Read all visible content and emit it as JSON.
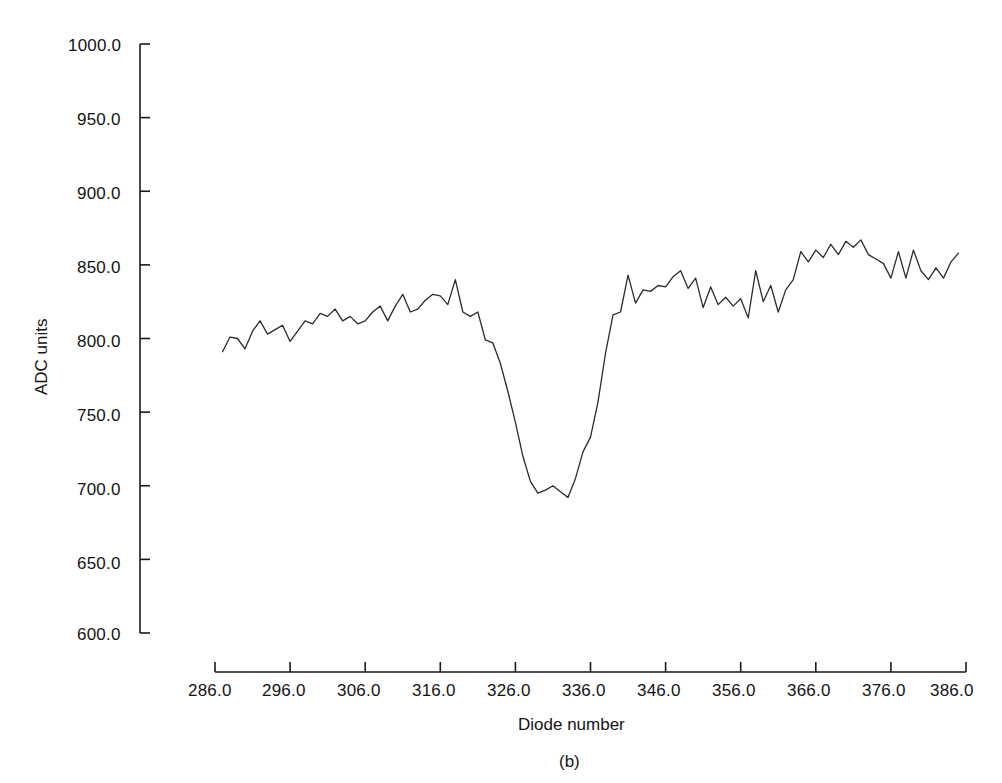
{
  "figure": {
    "caption": "(b)",
    "line_color": "#2b2b2b",
    "axis_color": "#1a1a1a",
    "background": "#ffffff"
  },
  "chart_data": {
    "type": "line",
    "title": "",
    "xlabel": "Diode number",
    "ylabel": "ADC units",
    "xlim": [
      286.0,
      386.0
    ],
    "ylim": [
      600.0,
      1000.0
    ],
    "grid": false,
    "legend": null,
    "xticks": [
      286.0,
      296.0,
      306.0,
      316.0,
      326.0,
      336.0,
      346.0,
      356.0,
      366.0,
      376.0,
      386.0
    ],
    "xtick_labels": [
      "286.0",
      "296.0",
      "306.0",
      "316.0",
      "326.0",
      "336.0",
      "346.0",
      "356.0",
      "366.0",
      "376.0",
      "386.0"
    ],
    "yticks": [
      600.0,
      650.0,
      700.0,
      750.0,
      800.0,
      850.0,
      900.0,
      950.0,
      1000.0
    ],
    "ytick_labels": [
      "600.0",
      "650.0",
      "700.0",
      "750.0",
      "800.0",
      "850.0",
      "900.0",
      "950.0",
      "1000.0"
    ],
    "series": [
      {
        "name": "diode response",
        "x": [
          287,
          288,
          289,
          290,
          291,
          292,
          293,
          294,
          295,
          296,
          297,
          298,
          299,
          300,
          301,
          302,
          303,
          304,
          305,
          306,
          307,
          308,
          309,
          310,
          311,
          312,
          313,
          314,
          315,
          316,
          317,
          318,
          319,
          320,
          321,
          322,
          323,
          324,
          325,
          326,
          327,
          328,
          329,
          330,
          331,
          332,
          333,
          334,
          335,
          336,
          337,
          338,
          339,
          340,
          341,
          342,
          343,
          344,
          345,
          346,
          347,
          348,
          349,
          350,
          351,
          352,
          353,
          354,
          355,
          356,
          357,
          358,
          359,
          360,
          361,
          362,
          363,
          364,
          365,
          366,
          367,
          368,
          369,
          370,
          371,
          372,
          373,
          374,
          375,
          376,
          377,
          378,
          379,
          380,
          381,
          382,
          383,
          384,
          385
        ],
        "values": [
          791,
          801,
          800,
          793,
          805,
          812,
          803,
          806,
          809,
          798,
          805,
          812,
          810,
          817,
          815,
          820,
          812,
          815,
          810,
          812,
          818,
          822,
          812,
          822,
          830,
          818,
          820,
          826,
          830,
          829,
          823,
          840,
          818,
          815,
          818,
          799,
          797,
          783,
          764,
          743,
          720,
          703,
          695,
          697,
          700,
          696,
          692,
          705,
          723,
          733,
          757,
          790,
          816,
          818,
          843,
          824,
          833,
          832,
          836,
          835,
          842,
          846,
          834,
          841,
          821,
          835,
          823,
          828,
          822,
          827,
          814,
          846,
          825,
          836,
          818,
          833,
          840,
          859,
          852,
          860,
          855,
          864,
          857,
          866,
          862,
          867,
          857,
          854,
          851,
          841,
          859,
          841,
          860,
          846,
          840,
          848,
          841,
          852,
          858
        ]
      }
    ]
  },
  "axes": {
    "y_label": "ADC units",
    "x_label": "Diode number"
  }
}
